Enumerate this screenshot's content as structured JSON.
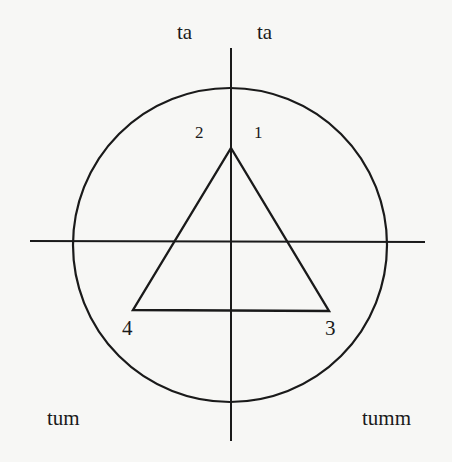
{
  "diagram": {
    "type": "circle-with-axes-and-inscribed-triangle",
    "stroke_color": "#1a1a1a",
    "background_color": "#f7f7f5",
    "circle": {
      "cx": 230,
      "cy": 245,
      "r": 157
    },
    "horizontal_axis": {
      "x1": 30,
      "y1": 241,
      "x2": 425,
      "y2": 242
    },
    "vertical_axis": {
      "x1": 231,
      "y1": 48,
      "x2": 231,
      "y2": 441
    },
    "triangle": {
      "points": [
        [
          231,
          148
        ],
        [
          329,
          311
        ],
        [
          133,
          310
        ]
      ]
    },
    "labels": {
      "top_left": "ta",
      "top_right": "ta",
      "vertex_2": "2",
      "vertex_1": "1",
      "vertex_4": "4",
      "vertex_3": "3",
      "bottom_left": "tum",
      "bottom_right": "tumm"
    }
  }
}
